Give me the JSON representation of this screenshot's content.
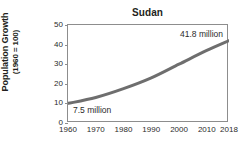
{
  "chart_data": {
    "type": "line",
    "title": "Sudan",
    "xlabel": "",
    "ylabel": "Population Growth (1960 = 100)",
    "ylabel_line1": "Population Growth",
    "ylabel_line2": "(1960 = 100)",
    "x": [
      1960,
      1970,
      1980,
      1990,
      2000,
      2010,
      2018
    ],
    "values": [
      10,
      13,
      17.5,
      23,
      30,
      37,
      42
    ],
    "series": [
      {
        "name": "Population Growth (1960 = 100)",
        "values": [
          10,
          13,
          17.5,
          23,
          30,
          37,
          42
        ]
      }
    ],
    "xticks": [
      "1960",
      "1970",
      "1980",
      "1990",
      "2000",
      "2010",
      "2018"
    ],
    "xtick_values": [
      1960,
      1970,
      1980,
      1990,
      2000,
      2010,
      2018
    ],
    "yticks": [
      "0",
      "10",
      "20",
      "30",
      "40",
      "50"
    ],
    "ytick_values": [
      0,
      10,
      20,
      30,
      40,
      50
    ],
    "xlim": [
      1960,
      2018
    ],
    "ylim": [
      0,
      50
    ],
    "grid": false,
    "legend": false,
    "line_color": "#6e6e6e",
    "axis_color": "#8d8d8d",
    "text_color": "#231f20",
    "annotations": [
      {
        "text": "7.5 million",
        "x": 1960,
        "y": 10,
        "position": "bottom-left"
      },
      {
        "text": "41.8 million",
        "x": 2018,
        "y": 42,
        "position": "top-right"
      }
    ],
    "annotation_start": "7.5 million",
    "annotation_end": "41.8 million"
  }
}
